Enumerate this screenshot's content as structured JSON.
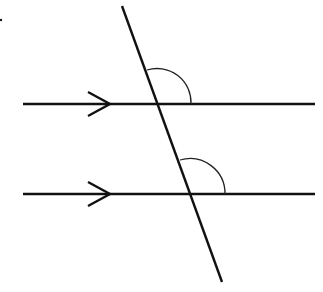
{
  "diagram": {
    "type": "parallel-lines-transversal",
    "colors": {
      "stroke": "#111111",
      "background": "#ffffff"
    },
    "parallel_lines": [
      {
        "name": "upper",
        "x1": 23,
        "y1": 104,
        "x2": 315,
        "y2": 104,
        "arrow": {
          "tip_x": 110,
          "tip_y": 104,
          "wing_x": 88,
          "wing_dy": 12
        }
      },
      {
        "name": "lower",
        "x1": 23,
        "y1": 194,
        "x2": 315,
        "y2": 194,
        "arrow": {
          "tip_x": 110,
          "tip_y": 194,
          "wing_x": 88,
          "wing_dy": 12
        }
      }
    ],
    "transversal": {
      "x1": 122,
      "y1": 6,
      "x2": 222,
      "y2": 282
    },
    "angle_arcs": [
      {
        "name": "upper-angle",
        "start_x": 147,
        "start_y": 70,
        "end_x": 191,
        "end_y": 104,
        "r": 34
      },
      {
        "name": "lower-angle",
        "start_x": 180,
        "start_y": 160,
        "end_x": 225,
        "end_y": 194,
        "r": 35
      }
    ],
    "dot": {
      "cx": 1,
      "cy": 20,
      "r": 1.2
    }
  }
}
